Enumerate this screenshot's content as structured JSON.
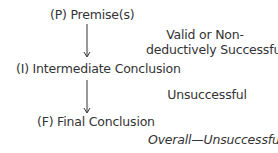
{
  "diagram": {
    "nodes": [
      {
        "id": "P",
        "label": "(P) Premise(s)"
      },
      {
        "id": "I",
        "label": "(I) Intermediate Conclusion"
      },
      {
        "id": "F",
        "label": "(F) Final Conclusion"
      }
    ],
    "edges": [
      {
        "from": "P",
        "to": "I",
        "annotation_line1": "Valid or Non-",
        "annotation_line2": "deductively Successful"
      },
      {
        "from": "I",
        "to": "F",
        "annotation": "Unsuccessful"
      }
    ],
    "overall": "Overall—Unsuccessful",
    "colors": {
      "text": "#333333",
      "background": "#ffffff"
    }
  }
}
